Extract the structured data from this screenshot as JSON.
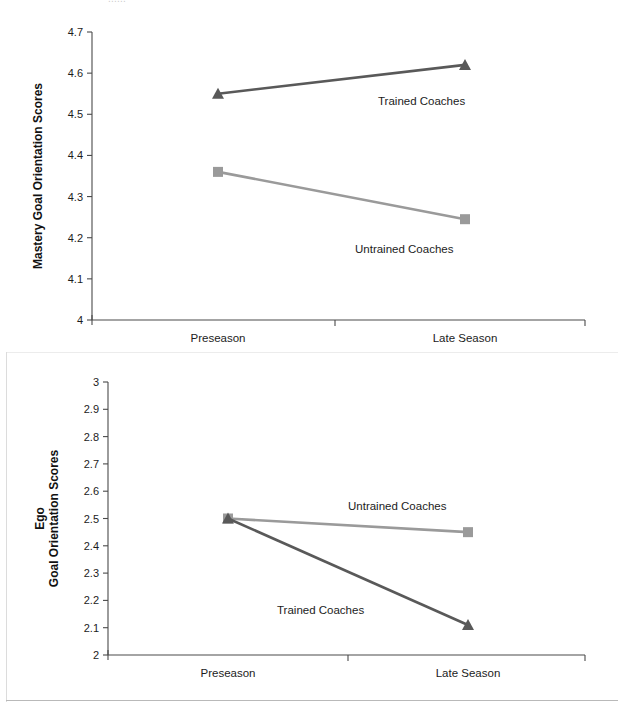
{
  "page": {
    "clipped_header_text": "......",
    "background_color": "#ffffff"
  },
  "colors": {
    "trained": "#595959",
    "untrained": "#9a9a9a",
    "axis": "#4a4a4a",
    "text": "#1c1c1c"
  },
  "chart_data": [
    {
      "id": "mastery",
      "type": "line",
      "title": "",
      "xlabel": "",
      "ylabel": "Mastery Goal Orientation Scores",
      "ylabel_lines": [
        "Mastery Goal Orientation Scores"
      ],
      "categories": [
        "Preseason",
        "Late Season"
      ],
      "ylim": [
        4,
        4.7
      ],
      "yticks": [
        "4",
        "4.1",
        "4.2",
        "4.3",
        "4.4",
        "4.5",
        "4.6",
        "4.7"
      ],
      "ytick_values": [
        4,
        4.1,
        4.2,
        4.3,
        4.4,
        4.5,
        4.6,
        4.7
      ],
      "grid": false,
      "legend_position": "inline-annotation",
      "series": [
        {
          "name": "Trained Coaches",
          "values": [
            4.55,
            4.62
          ],
          "color": "#595959",
          "marker": "triangle",
          "label_x": 378,
          "label_y": 95
        },
        {
          "name": "Untrained Coaches",
          "values": [
            4.36,
            4.245
          ],
          "color": "#9a9a9a",
          "marker": "square",
          "label_x": 355,
          "label_y": 243
        }
      ]
    },
    {
      "id": "ego",
      "type": "line",
      "title": "",
      "xlabel": "",
      "ylabel": "Ego Goal Orientation Scores",
      "ylabel_lines": [
        "Ego",
        "Goal Orientation Scores"
      ],
      "categories": [
        "Preseason",
        "Late Season"
      ],
      "ylim": [
        2,
        3
      ],
      "yticks": [
        "2",
        "2.1",
        "2.2",
        "2.3",
        "2.4",
        "2.5",
        "2.6",
        "2.7",
        "2.8",
        "2.9",
        "3"
      ],
      "ytick_values": [
        2,
        2.1,
        2.2,
        2.3,
        2.4,
        2.5,
        2.6,
        2.7,
        2.8,
        2.9,
        3
      ],
      "grid": false,
      "legend_position": "inline-annotation",
      "series": [
        {
          "name": "Untrained Coaches",
          "values": [
            2.5,
            2.45
          ],
          "color": "#9a9a9a",
          "marker": "square",
          "label_x": 348,
          "label_y": 148
        },
        {
          "name": "Trained Coaches",
          "values": [
            2.5,
            2.11
          ],
          "color": "#595959",
          "marker": "triangle",
          "label_x": 277,
          "label_y": 252
        }
      ]
    }
  ]
}
